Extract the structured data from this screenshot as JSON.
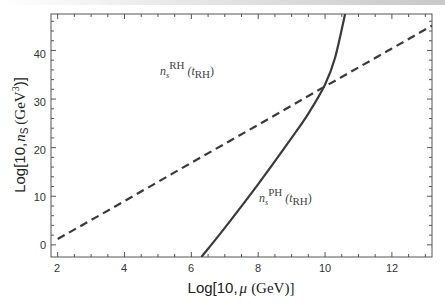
{
  "chart_data": {
    "type": "line",
    "title": "",
    "xlabel": "Log[10, μ (GeV)]",
    "ylabel": "Log[10, n_s (GeV^3)]",
    "xlim": [
      1.8,
      13.2
    ],
    "ylim": [
      -2.5,
      47.5
    ],
    "x_ticks": [
      2,
      4,
      6,
      8,
      10,
      12
    ],
    "y_ticks": [
      0,
      10,
      20,
      30,
      40
    ],
    "grid": false,
    "legend": null,
    "series": [
      {
        "name": "n_s^RH (t_RH)",
        "style": "dashed",
        "x": [
          2,
          4,
          6,
          8,
          10,
          12,
          13.2
        ],
        "y": [
          1.2,
          9.0,
          16.9,
          24.7,
          32.6,
          40.4,
          45.1
        ]
      },
      {
        "name": "n_s^PH (t_RH)",
        "style": "solid",
        "x": [
          6.3,
          7.0,
          8.0,
          9.0,
          9.5,
          10.0,
          10.3,
          10.6
        ],
        "y": [
          -2.5,
          3.5,
          12.5,
          22.0,
          27.0,
          33.0,
          38.5,
          47.5
        ]
      }
    ],
    "annotations": [
      {
        "text_main": "n",
        "sub": "s",
        "sup": "RH",
        "arg": "(t",
        "arg_sub": "RH",
        "arg_close": ")",
        "x": 5.0,
        "y": 38
      },
      {
        "text_main": "n",
        "sub": "s",
        "sup": "PH",
        "arg": "(t",
        "arg_sub": "RH",
        "arg_close": ")",
        "x": 8.6,
        "y": 7.5
      }
    ]
  },
  "labels": {
    "xlabel_main": "Log[10,",
    "xlabel_mu": "μ",
    "xlabel_unit": "(GeV)]",
    "ylabel_main": "Log[10,",
    "ylabel_n": "n",
    "ylabel_sub": "S",
    "ylabel_unit": "(GeV",
    "ylabel_sup": "3",
    "ylabel_close": ")]",
    "anno1_n": "n",
    "anno1_s": "s",
    "anno1_sup": "RH",
    "anno1_arg": "(t",
    "anno1_argsub": "RH",
    "anno1_close": ")",
    "anno2_n": "n",
    "anno2_s": "s",
    "anno2_sup": "PH",
    "anno2_arg": "(t",
    "anno2_argsub": "RH",
    "anno2_close": ")"
  },
  "ticks": {
    "x": [
      "2",
      "4",
      "6",
      "8",
      "10",
      "12"
    ],
    "y": [
      "0",
      "10",
      "20",
      "30",
      "40"
    ]
  }
}
